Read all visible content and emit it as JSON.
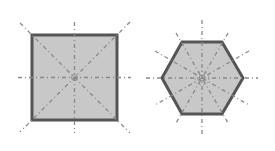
{
  "diagram": {
    "colors": {
      "fill": "#c8c8c8",
      "outline": "#555555",
      "axis": "#888888",
      "background": "#ffffff"
    },
    "shapes": [
      {
        "name": "square",
        "sides": 4,
        "lines_of_symmetry": 4,
        "center": [
          74,
          77
        ]
      },
      {
        "name": "regular-hexagon",
        "sides": 6,
        "lines_of_symmetry": 6,
        "center": [
          202,
          78
        ]
      }
    ]
  }
}
